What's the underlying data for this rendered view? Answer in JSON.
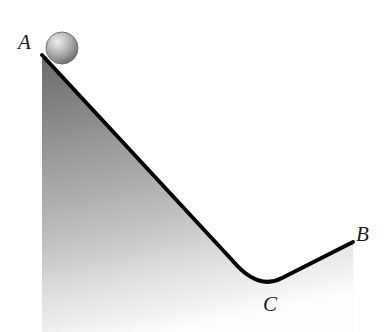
{
  "figure": {
    "type": "physics-ramp-diagram",
    "background_color": "#ffffff",
    "width": 392,
    "height": 332,
    "labels": {
      "start_point": "A",
      "end_point": "B",
      "valley_point": "C"
    },
    "label_positions": {
      "A": {
        "x": 28,
        "y": 44
      },
      "B": {
        "x": 364,
        "y": 236
      },
      "C": {
        "x": 271,
        "y": 306
      }
    },
    "ball": {
      "name": "sphere",
      "center_x": 62,
      "center_y": 48,
      "radius": 16,
      "highlight_color": "#e8e8e8",
      "mid_color": "#a8a8a8",
      "edge_color": "#5a5a5a",
      "outline_color": "#6e6e6e"
    },
    "surface": {
      "stroke_color": "#000000",
      "stroke_width": 4,
      "apex_A": {
        "x": 42,
        "y": 55
      },
      "valley_C": {
        "x": 270,
        "y": 290
      },
      "end_B": {
        "x": 353,
        "y": 242
      },
      "left_edge_x": 42,
      "right_edge_x": 355,
      "bottom_y": 332
    },
    "shading": {
      "top_color": "#6f6f6f",
      "mid_color": "#b4b4b4",
      "bottom_color": "#fdfdfd"
    }
  }
}
